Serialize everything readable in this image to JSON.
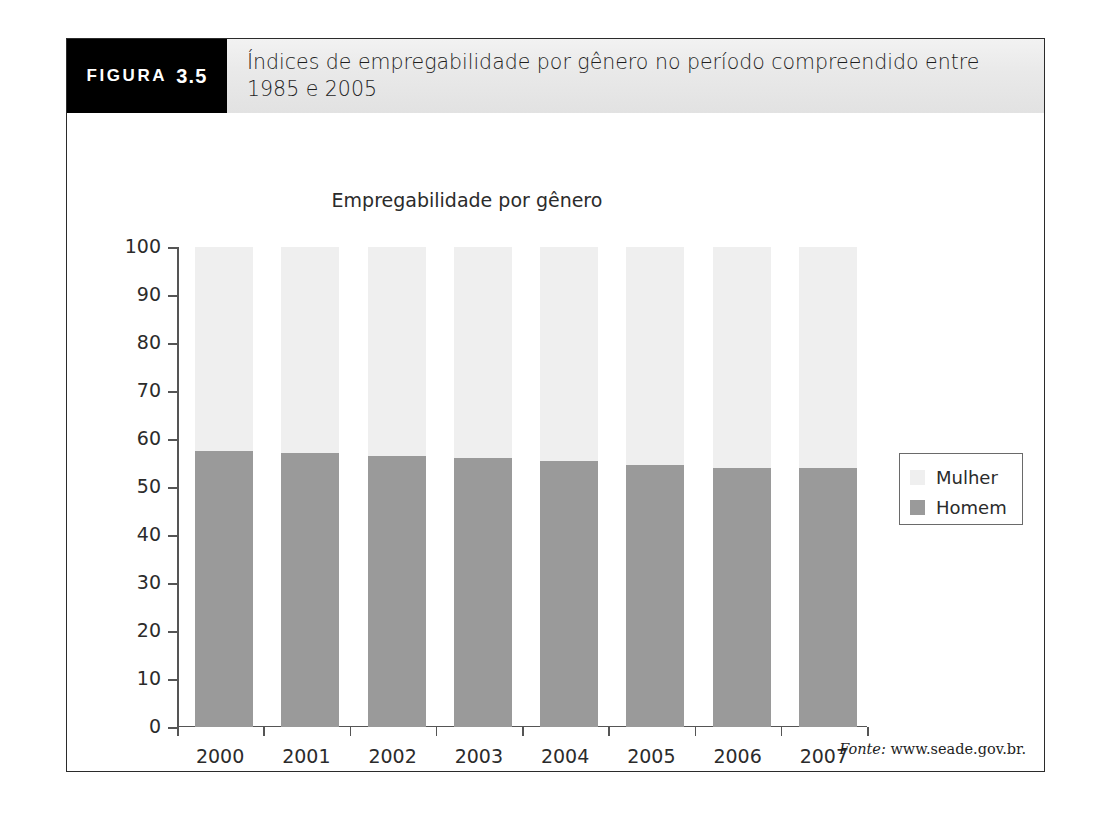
{
  "figure": {
    "badge_word": "FIGURA",
    "badge_number": "3.5",
    "caption": "Índices de empregabilidade por gênero no período compreendido entre 1985 e 2005",
    "source_lead": "Fonte:",
    "source_value": "www.seade.gov.br."
  },
  "legend": {
    "items": [
      {
        "label": "Mulher",
        "color": "#efefef"
      },
      {
        "label": "Homem",
        "color": "#9a9a9a"
      }
    ]
  },
  "colors": {
    "mulher": "#efefef",
    "homem": "#9a9a9a",
    "axis": "#555555",
    "badge_bg": "#000000",
    "header_bg": "#e9e9e9"
  },
  "chart_data": {
    "type": "bar",
    "subtype": "stacked-100-percent",
    "title": "Empregabilidade por gênero",
    "xlabel": "",
    "ylabel": "",
    "categories": [
      "2000",
      "2001",
      "2002",
      "2003",
      "2004",
      "2005",
      "2006",
      "2007"
    ],
    "series": [
      {
        "name": "Homem",
        "color": "#9a9a9a",
        "values": [
          57.5,
          57.0,
          56.5,
          56.0,
          55.5,
          54.5,
          54.0,
          54.0
        ]
      },
      {
        "name": "Mulher",
        "color": "#efefef",
        "values": [
          42.5,
          43.0,
          43.5,
          44.0,
          44.5,
          45.5,
          46.0,
          46.0
        ]
      }
    ],
    "ylim": [
      0,
      100
    ],
    "yticks": [
      0,
      10,
      20,
      30,
      40,
      50,
      60,
      70,
      80,
      90,
      100
    ],
    "ytick_labels": [
      "0",
      "10",
      "20",
      "30",
      "40",
      "50",
      "60",
      "70",
      "80",
      "90",
      "100"
    ],
    "grid": false,
    "legend_position": "right"
  }
}
